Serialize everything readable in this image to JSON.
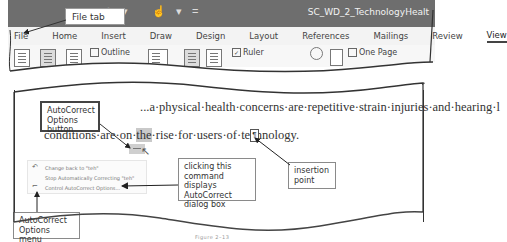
{
  "titlebar": {
    "doc_title": "SC_WD_2_TechnologyHealt",
    "qat": {
      "undo": "↶",
      "undo_dropdown": "▾",
      "touch_mode": "☝",
      "touch_dropdown": "▾",
      "customize": "="
    },
    "bg_color": "#6e6e6e"
  },
  "ribbon": {
    "tabs": [
      {
        "label": "File"
      },
      {
        "label": "Home"
      },
      {
        "label": "Insert"
      },
      {
        "label": "Draw"
      },
      {
        "label": "Design"
      },
      {
        "label": "Layout"
      },
      {
        "label": "References"
      },
      {
        "label": "Mailings"
      },
      {
        "label": "Review"
      },
      {
        "label": "View",
        "active": true
      }
    ],
    "view_group": {
      "outline_label": "Outline",
      "ruler_label": "Ruler",
      "ruler_checked": true,
      "one_page_label": "One Page",
      "multiple_pages_label": "Multiple Pages"
    }
  },
  "document": {
    "cut_text": "The ... has led ...",
    "line1_visible": "...a·physical·health·concerns·are·repetitive·strain·injuries·and·hearing·l",
    "line2_before": "conditions·are·on·",
    "line2_highlight": "the",
    "line2_after": "·rise·for·users·of·technology.",
    "paragraph_mark": "¶"
  },
  "autocorrect_menu": {
    "items": [
      {
        "icon": "undo-icon",
        "glyph": "↶",
        "label": "Change back to \"teh\""
      },
      {
        "icon": "",
        "glyph": "",
        "label": "Stop Automatically Correcting \"teh\""
      },
      {
        "icon": "autocorrect-options-icon",
        "glyph": "⌐",
        "label": "Control AutoCorrect Options..."
      }
    ]
  },
  "callouts": {
    "file_tab": "File tab",
    "autocorrect_button": "AutoCorrect Options button",
    "clicking_command": "clicking this command displays AutoCorrect dialog box",
    "insertion_point": "insertion point",
    "autocorrect_menu": "AutoCorrect Options menu"
  },
  "caption": "Figure 2–13"
}
